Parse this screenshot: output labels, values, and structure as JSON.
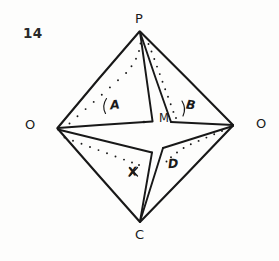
{
  "figure": {
    "number": "14",
    "kind": "hand-drawn geometry diagram",
    "background_color": "#fdfdfc",
    "ink_color": "#1a1a1a"
  },
  "vertices": {
    "top": {
      "label": "P",
      "x": 140,
      "y": 31
    },
    "left": {
      "label": "O",
      "x": 57,
      "y": 128
    },
    "right": {
      "label": "O",
      "x": 233,
      "y": 125
    },
    "bottom": {
      "label": "C",
      "x": 140,
      "y": 222
    }
  },
  "center_point": {
    "label": "M",
    "dot_x": 144,
    "dot_y": 122
  },
  "flaps": [
    {
      "label": "A",
      "position": "upper-left",
      "has_angle_arc": true
    },
    {
      "label": "B",
      "position": "upper-right",
      "has_angle_arc": true
    },
    {
      "label": "X",
      "position": "lower-left",
      "has_angle_arc": false
    },
    {
      "label": "D",
      "position": "lower-right",
      "has_angle_arc": false
    }
  ],
  "geometry": {
    "outer_diamond": "57,128 140,31 233,125 140,222",
    "flap_a": "57,128 140,31 152,121",
    "flap_b": "140,31 233,125 171,122",
    "flap_x": "57,128 140,222 152,152",
    "flap_d": "233,125 140,222 163,148",
    "dotted_a": "70,124 146,52",
    "dotted_b": "149,44 176,117",
    "dotted_x": "64,138 148,168",
    "dotted_d": "222,131 167,162"
  },
  "strokes": {
    "outline_width": 2.0,
    "inner_width": 1.7,
    "dot_radius": 1.0
  }
}
